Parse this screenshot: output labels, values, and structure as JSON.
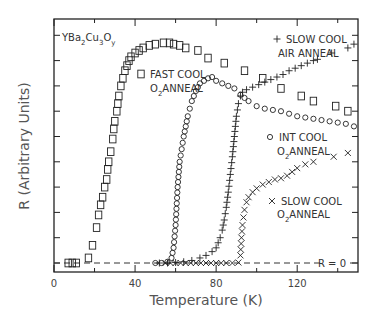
{
  "chart_data": {
    "type": "scatter",
    "title": "",
    "compound_label": {
      "base": "YBa",
      "sub1": "2",
      "mid1": "Cu",
      "sub2": "3",
      "mid2": "O",
      "sub3": "y"
    },
    "xlabel": "Temperature (K)",
    "ylabel": "R (Arbitrary Units)",
    "xlim": [
      0,
      150
    ],
    "ylim": [
      -0.35,
      9.65
    ],
    "xticks": [
      0,
      40,
      80,
      120
    ],
    "xminor": [
      20,
      60,
      100,
      140
    ],
    "yticks_unlabeled": [
      0,
      1,
      2,
      3,
      4,
      5,
      6,
      7,
      8,
      9
    ],
    "grid": false,
    "reference_line": {
      "y": 0,
      "label": "R = 0",
      "style": "dashed"
    },
    "series": [
      {
        "name": "FAST COOL O2ANNEAL",
        "label_line1": "FAST COOL",
        "label_line2_prefix": "O",
        "label_line2_sub": "2",
        "label_line2_suffix": "ANNEAL",
        "marker": "square",
        "points": [
          [
            7,
            0
          ],
          [
            9,
            0
          ],
          [
            11,
            0
          ],
          [
            17,
            0.2
          ],
          [
            19,
            0.7
          ],
          [
            21,
            1.4
          ],
          [
            22,
            1.9
          ],
          [
            23,
            2.3
          ],
          [
            24,
            2.6
          ],
          [
            25,
            3.0
          ],
          [
            26,
            3.3
          ],
          [
            26.5,
            3.7
          ],
          [
            27,
            4.0
          ],
          [
            28,
            4.4
          ],
          [
            29,
            4.9
          ],
          [
            29.5,
            5.3
          ],
          [
            30,
            5.6
          ],
          [
            31,
            6.0
          ],
          [
            31.5,
            6.3
          ],
          [
            32,
            6.6
          ],
          [
            33,
            7.0
          ],
          [
            34,
            7.3
          ],
          [
            35,
            7.6
          ],
          [
            36,
            7.8
          ],
          [
            37,
            8.0
          ],
          [
            38,
            8.15
          ],
          [
            40,
            8.3
          ],
          [
            42,
            8.4
          ],
          [
            44,
            8.5
          ],
          [
            47,
            8.6
          ],
          [
            50,
            8.65
          ],
          [
            54,
            8.7
          ],
          [
            57,
            8.7
          ],
          [
            59,
            8.65
          ],
          [
            62,
            8.6
          ],
          [
            65,
            8.5
          ],
          [
            71,
            8.4
          ],
          [
            76,
            8.1
          ],
          [
            84,
            7.9
          ],
          [
            94,
            7.6
          ],
          [
            103,
            7.3
          ],
          [
            112,
            6.9
          ],
          [
            122,
            6.6
          ],
          [
            128,
            6.4
          ],
          [
            139,
            6.2
          ],
          [
            145,
            6.0
          ]
        ]
      },
      {
        "name": "SLOW COOL AIR ANNEAL",
        "label_line1": "SLOW COOL",
        "label_line2": "AIR ANNEAL",
        "marker": "plus",
        "points": [
          [
            52,
            0
          ],
          [
            56,
            0
          ],
          [
            60,
            0.02
          ],
          [
            64,
            0.05
          ],
          [
            68,
            0.1
          ],
          [
            72,
            0.2
          ],
          [
            75,
            0.3
          ],
          [
            78,
            0.45
          ],
          [
            80,
            0.6
          ],
          [
            81,
            0.8
          ],
          [
            82,
            1.0
          ],
          [
            83,
            1.3
          ],
          [
            84,
            1.7
          ],
          [
            85,
            2.2
          ],
          [
            86,
            2.8
          ],
          [
            87,
            3.5
          ],
          [
            88,
            4.2
          ],
          [
            89,
            5.0
          ],
          [
            90,
            5.8
          ],
          [
            91,
            6.3
          ],
          [
            92,
            6.6
          ],
          [
            93,
            6.75
          ],
          [
            95,
            6.85
          ],
          [
            98,
            6.95
          ],
          [
            101,
            7.05
          ],
          [
            104,
            7.15
          ],
          [
            107,
            7.25
          ],
          [
            110,
            7.35
          ],
          [
            113,
            7.45
          ],
          [
            116,
            7.6
          ],
          [
            119,
            7.7
          ],
          [
            122,
            7.8
          ],
          [
            125,
            7.9
          ],
          [
            128,
            8.0
          ],
          [
            130,
            8.05
          ],
          [
            137,
            8.3
          ],
          [
            145,
            8.5
          ],
          [
            148,
            8.65
          ]
        ]
      },
      {
        "name": "INT COOL O2ANNEAL",
        "label_line1": "INT COOL",
        "label_line2_prefix": "O",
        "label_line2_sub": "2",
        "label_line2_suffix": "ANNEAL",
        "marker": "circle",
        "points": [
          [
            50,
            0
          ],
          [
            53,
            0
          ],
          [
            56,
            0.05
          ],
          [
            58,
            0.2
          ],
          [
            59,
            0.6
          ],
          [
            60,
            1.5
          ],
          [
            61,
            3.0
          ],
          [
            62,
            4.0
          ],
          [
            63,
            4.5
          ],
          [
            64,
            5.0
          ],
          [
            65,
            5.4
          ],
          [
            66,
            5.8
          ],
          [
            67,
            6.1
          ],
          [
            68,
            6.4
          ],
          [
            69,
            6.6
          ],
          [
            70,
            6.8
          ],
          [
            71,
            6.95
          ],
          [
            72,
            7.1
          ],
          [
            74,
            7.2
          ],
          [
            76,
            7.3
          ],
          [
            78,
            7.35
          ],
          [
            80,
            7.2
          ],
          [
            83,
            7.1
          ],
          [
            86,
            7.0
          ],
          [
            89,
            6.9
          ],
          [
            92,
            6.65
          ],
          [
            96,
            6.4
          ],
          [
            100,
            6.2
          ],
          [
            104,
            6.1
          ],
          [
            108,
            6.05
          ],
          [
            112,
            6.0
          ],
          [
            116,
            5.9
          ],
          [
            120,
            5.8
          ],
          [
            124,
            5.75
          ],
          [
            128,
            5.7
          ],
          [
            132,
            5.65
          ],
          [
            136,
            5.6
          ],
          [
            140,
            5.55
          ],
          [
            144,
            5.5
          ],
          [
            148,
            5.4
          ]
        ]
      },
      {
        "name": "SLOW COOL O2ANNEAL",
        "label_line1": "SLOW COOL",
        "label_line2_prefix": "O",
        "label_line2_sub": "2",
        "label_line2_suffix": "ANNEAL",
        "marker": "cross",
        "points": [
          [
            55,
            0
          ],
          [
            60,
            0
          ],
          [
            65,
            0
          ],
          [
            70,
            0
          ],
          [
            75,
            0
          ],
          [
            80,
            0
          ],
          [
            85,
            0
          ],
          [
            88,
            0
          ],
          [
            91,
            0.02
          ],
          [
            92,
            0.3
          ],
          [
            92.5,
            1.0
          ],
          [
            93,
            1.5
          ],
          [
            93.5,
            1.8
          ],
          [
            94,
            2.1
          ],
          [
            95,
            2.4
          ],
          [
            96,
            2.6
          ],
          [
            98,
            2.8
          ],
          [
            100,
            2.95
          ],
          [
            103,
            3.1
          ],
          [
            106,
            3.2
          ],
          [
            109,
            3.3
          ],
          [
            112,
            3.35
          ],
          [
            115,
            3.45
          ],
          [
            120,
            3.75
          ],
          [
            124,
            3.9
          ],
          [
            128,
            4.0
          ],
          [
            138,
            4.2
          ],
          [
            145,
            4.35
          ]
        ]
      }
    ]
  }
}
